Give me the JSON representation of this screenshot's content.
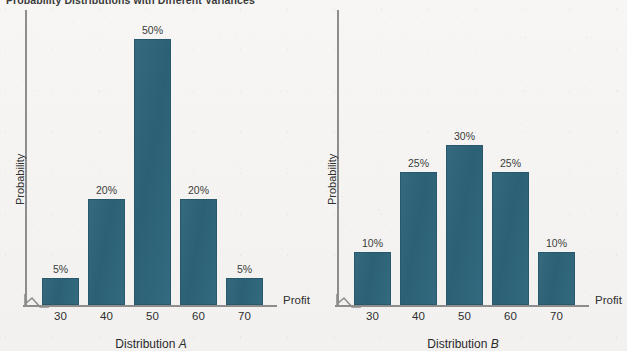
{
  "figure": {
    "title": "Probability Distributions with Different Variances",
    "bar_color": "#2f6479",
    "axis_color": "#8d8d8d",
    "background": "#f5f4f2"
  },
  "chart_data": [
    {
      "type": "bar",
      "title": "Distribution A",
      "caption_prefix": "Distribution",
      "caption_suffix": "A",
      "categories": [
        "30",
        "40",
        "50",
        "60",
        "70"
      ],
      "values": [
        5,
        20,
        50,
        20,
        5
      ],
      "data_labels": [
        "5%",
        "20%",
        "50%",
        "20%",
        "5%"
      ],
      "xlabel": "Profit",
      "ylabel": "Probability",
      "ylim": [
        0,
        55
      ],
      "grid": false,
      "legend": "none",
      "axis_break": true
    },
    {
      "type": "bar",
      "title": "Distribution B",
      "caption_prefix": "Distribution",
      "caption_suffix": "B",
      "categories": [
        "30",
        "40",
        "50",
        "60",
        "70"
      ],
      "values": [
        10,
        25,
        30,
        25,
        10
      ],
      "data_labels": [
        "10%",
        "25%",
        "30%",
        "25%",
        "10%"
      ],
      "xlabel": "Profit",
      "ylabel": "Probability",
      "ylim": [
        0,
        55
      ],
      "grid": false,
      "legend": "none",
      "axis_break": true
    }
  ]
}
